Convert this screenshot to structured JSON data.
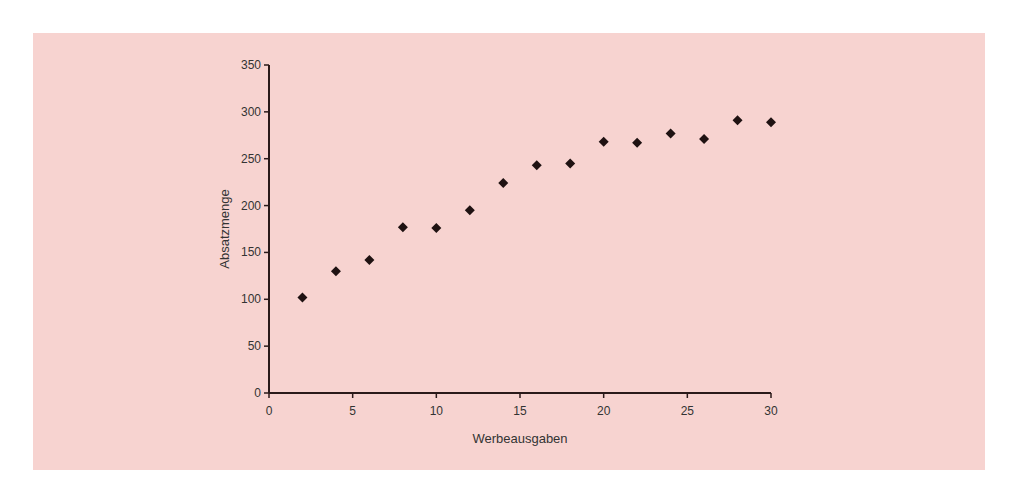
{
  "colors": {
    "background": "#f7d3d0",
    "axis": "#2a1a1a",
    "marker": "#1f1212"
  },
  "chart_data": {
    "type": "scatter",
    "title": "",
    "xlabel": "Werbeausgaben",
    "ylabel": "Absatzmenge",
    "xlim": [
      0,
      30
    ],
    "ylim": [
      0,
      350
    ],
    "xticks": [
      0,
      5,
      10,
      15,
      20,
      25,
      30
    ],
    "yticks": [
      0,
      50,
      100,
      150,
      200,
      250,
      300,
      350
    ],
    "grid": false,
    "legend": null,
    "marker": "diamond",
    "x": [
      2,
      4,
      6,
      8,
      10,
      12,
      14,
      16,
      18,
      20,
      22,
      24,
      26,
      28,
      30
    ],
    "y": [
      102,
      130,
      142,
      177,
      176,
      195,
      224,
      243,
      245,
      268,
      267,
      277,
      271,
      291,
      289
    ]
  }
}
